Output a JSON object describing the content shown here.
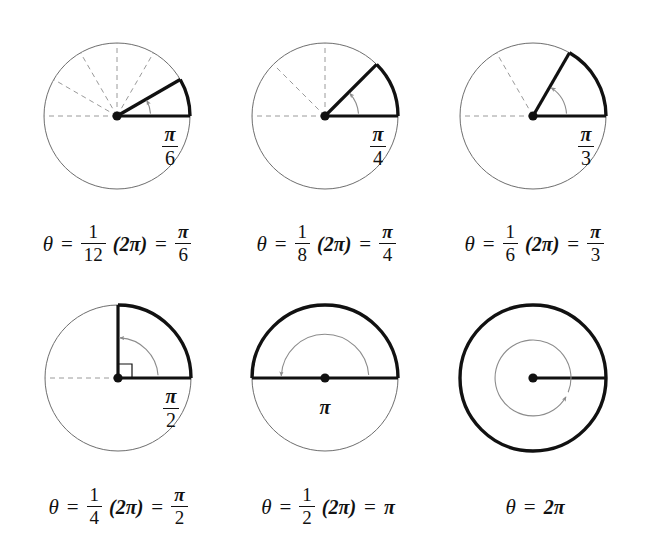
{
  "figure": {
    "background_color": "#ffffff",
    "ink_color": "#111111",
    "dashed_color": "#9a9a9a",
    "thin_arc_color": "#8c8c8c",
    "circle_outline_color": "#6e6e6e"
  },
  "panels": [
    {
      "id": "panel-pi-over-6",
      "center": {
        "x": 117,
        "y": 116
      },
      "radius": 73,
      "angle_deg": 30,
      "angle_label": {
        "kind": "fraction",
        "numerator": "π",
        "denominator": "6"
      },
      "divisions": 12,
      "dashed_rays_deg": [
        30,
        60,
        90,
        120,
        150,
        180
      ],
      "right_angle_marker": false,
      "caption": {
        "theta": "θ",
        "equals": "=",
        "fraction": {
          "numerator": "1",
          "denominator": "12"
        },
        "times": "(2π)",
        "equals2": "=",
        "result": {
          "numerator": "π",
          "denominator": "6"
        },
        "plain_result": ""
      }
    },
    {
      "id": "panel-pi-over-4",
      "center": {
        "x": 325,
        "y": 116
      },
      "radius": 73,
      "angle_deg": 45,
      "angle_label": {
        "kind": "fraction",
        "numerator": "π",
        "denominator": "4"
      },
      "divisions": 8,
      "dashed_rays_deg": [
        45,
        90,
        135,
        180
      ],
      "right_angle_marker": false,
      "caption": {
        "theta": "θ",
        "equals": "=",
        "fraction": {
          "numerator": "1",
          "denominator": "8"
        },
        "times": "(2π)",
        "equals2": "=",
        "result": {
          "numerator": "π",
          "denominator": "4"
        },
        "plain_result": ""
      }
    },
    {
      "id": "panel-pi-over-3",
      "center": {
        "x": 533,
        "y": 116
      },
      "radius": 73,
      "angle_deg": 60,
      "angle_label": {
        "kind": "fraction",
        "numerator": "π",
        "denominator": "3"
      },
      "divisions": 6,
      "dashed_rays_deg": [
        120,
        180
      ],
      "right_angle_marker": false,
      "caption": {
        "theta": "θ",
        "equals": "=",
        "fraction": {
          "numerator": "1",
          "denominator": "6"
        },
        "times": "(2π)",
        "equals2": "=",
        "result": {
          "numerator": "π",
          "denominator": "3"
        },
        "plain_result": ""
      }
    },
    {
      "id": "panel-pi-over-2",
      "center": {
        "x": 118,
        "y": 378
      },
      "radius": 73,
      "angle_deg": 90,
      "angle_label": {
        "kind": "fraction",
        "numerator": "π",
        "denominator": "2"
      },
      "divisions": 4,
      "dashed_rays_deg": [
        180
      ],
      "right_angle_marker": true,
      "caption": {
        "theta": "θ",
        "equals": "=",
        "fraction": {
          "numerator": "1",
          "denominator": "4"
        },
        "times": "(2π)",
        "equals2": "=",
        "result": {
          "numerator": "π",
          "denominator": "2"
        },
        "plain_result": ""
      }
    },
    {
      "id": "panel-pi",
      "center": {
        "x": 325,
        "y": 378
      },
      "radius": 73,
      "angle_deg": 180,
      "angle_label": {
        "kind": "plain",
        "text": "π"
      },
      "divisions": 2,
      "dashed_rays_deg": [],
      "right_angle_marker": false,
      "caption": {
        "theta": "θ",
        "equals": "=",
        "fraction": {
          "numerator": "1",
          "denominator": "2"
        },
        "times": "(2π)",
        "equals2": "=",
        "result": null,
        "plain_result": "π"
      }
    },
    {
      "id": "panel-two-pi",
      "center": {
        "x": 533,
        "y": 378
      },
      "radius": 73,
      "angle_deg": 360,
      "angle_label": {
        "kind": "none",
        "text": ""
      },
      "divisions": 1,
      "dashed_rays_deg": [],
      "right_angle_marker": false,
      "caption": {
        "theta": "θ",
        "equals": "=",
        "fraction": null,
        "times": "",
        "equals2": "",
        "result": null,
        "plain_result": "2π"
      }
    }
  ],
  "chart_data": {
    "type": "diagram",
    "categories": [
      "1/12 turn",
      "1/8 turn",
      "1/6 turn",
      "1/4 turn",
      "1/2 turn",
      "1 turn"
    ],
    "values_radians": [
      0.5236,
      0.7854,
      1.0472,
      1.5708,
      3.1416,
      6.2832
    ],
    "values_degrees": [
      30,
      45,
      60,
      90,
      180,
      360
    ],
    "labels": [
      "π/6",
      "π/4",
      "π/3",
      "π/2",
      "π",
      "2π"
    ],
    "fractions_of_turn": [
      "1/12",
      "1/8",
      "1/6",
      "1/4",
      "1/2",
      "1"
    ],
    "captions": [
      "θ = 1/12 (2π) = π/6",
      "θ = 1/8 (2π) = π/4",
      "θ = 1/6 (2π) = π/3",
      "θ = 1/4 (2π) = π/2",
      "θ = 1/2 (2π) = π",
      "θ = 2π"
    ],
    "grid": false,
    "legend": "none"
  },
  "bottom_sliver_text": ""
}
